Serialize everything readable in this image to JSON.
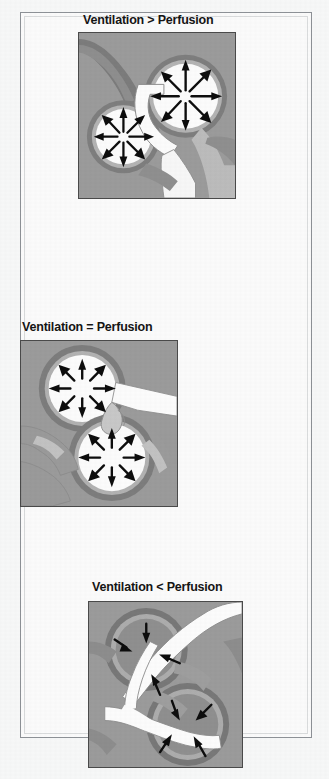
{
  "figure": {
    "type": "medical-illustration",
    "background_color": "#f7f8f8",
    "frame_color": "#8d9196",
    "panel_background_color": "#9b9b9b",
    "panel_border_color": "#4a4a4a",
    "lung_fill_color": "#d8d8d8",
    "lung_outline_color": "#9aa0a4",
    "airway_fill_color": "#fbfbfb",
    "arrow_color": "#111111",
    "gray_arrow_color": "#6f6f6f"
  },
  "panels": [
    {
      "id": "panel-1",
      "title": "Ventilation > Perfusion",
      "position": "top",
      "x": 78,
      "y": 32,
      "width": 158,
      "height": 167,
      "description": "Two widely expanded alveoli with many outward air-flow arrows; narrowed capillary blood supply",
      "alveoli_count": 2,
      "arrow_direction": "outward",
      "arrows_per_alveolus": 8,
      "connector": {
        "name": "up-arrow",
        "color": "#111111",
        "direction": "up"
      }
    },
    {
      "id": "panel-2",
      "title": "Ventilation = Perfusion",
      "position": "middle",
      "x": 20,
      "y": 340,
      "width": 158,
      "height": 167,
      "description": "Two balanced alveoli with matched inward arrows and normal capillary perfusion",
      "alveoli_count": 2,
      "arrow_direction": "inward",
      "arrows_per_alveolus": 8,
      "connector": {
        "name": "curved-arrow",
        "color": "#111111",
        "direction": "left"
      }
    },
    {
      "id": "panel-3",
      "title": "Ventilation < Perfusion",
      "position": "bottom",
      "x": 88,
      "y": 601,
      "width": 155,
      "height": 167,
      "description": "Two collapsed / poorly ventilated alveoli with few short inward arrows and wide perfused vessels",
      "alveoli_count": 2,
      "arrow_direction": "inward",
      "arrows_per_alveolus": 4,
      "connector": {
        "name": "straight-arrow",
        "color": "#111111",
        "direction": "right"
      }
    }
  ],
  "annotations": {
    "gray_arrow": {
      "name": "gray-down-left-arrow",
      "color": "#6f6f6f",
      "direction": "down-left"
    }
  },
  "bleed_text": "",
  "icons": {
    "inward_arrow": "inward-arrow-icon",
    "outward_arrow": "outward-arrow-icon",
    "up_arrow": "up-arrow-icon",
    "curved_arrow": "curved-arrow-icon"
  }
}
